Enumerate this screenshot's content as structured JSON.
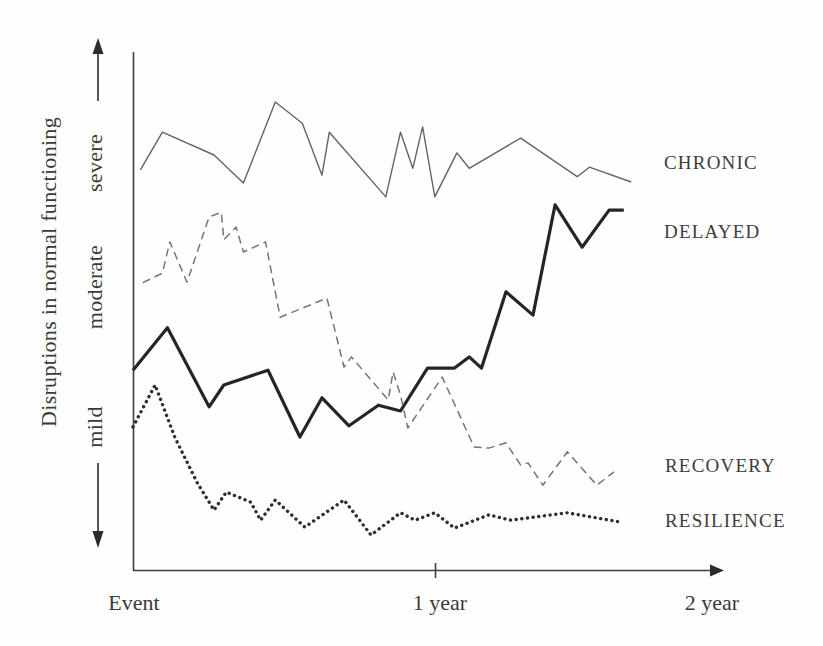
{
  "chart_data": {
    "type": "line",
    "title": "",
    "ylabel": "Disruptions in normal functioning",
    "xlabel": "",
    "x_axis": {
      "tick_labels": [
        "Event",
        "1 year",
        "2 year"
      ],
      "tick_months": [
        0,
        12,
        24
      ],
      "range_months": [
        0,
        24
      ]
    },
    "y_axis": {
      "tick_labels": [
        "severe",
        "moderate",
        "mild"
      ],
      "tick_positions": [
        77,
        53,
        27
      ],
      "range": [
        0,
        100
      ],
      "arrows": "double-ended"
    },
    "grid": false,
    "legend_position": "right of line endpoints",
    "axis_color": "#3f3f3f",
    "series": [
      {
        "name": "CHRONIC",
        "style": "thin-solid",
        "color": "#646464",
        "points": [
          [
            0.3,
            75.5
          ],
          [
            1.2,
            82.6
          ],
          [
            3.3,
            78.3
          ],
          [
            4.5,
            73.0
          ],
          [
            5.8,
            88.3
          ],
          [
            6.9,
            84.3
          ],
          [
            7.7,
            74.5
          ],
          [
            8.0,
            82.6
          ],
          [
            10.3,
            70.4
          ],
          [
            10.9,
            82.6
          ],
          [
            11.4,
            75.8
          ],
          [
            11.8,
            83.6
          ],
          [
            12.3,
            70.4
          ],
          [
            13.2,
            78.7
          ],
          [
            13.7,
            75.8
          ],
          [
            15.8,
            81.5
          ],
          [
            18.1,
            74.2
          ],
          [
            18.6,
            76.0
          ],
          [
            20.3,
            73.2
          ]
        ]
      },
      {
        "name": "DELAYED",
        "style": "thick-solid",
        "color": "#252525",
        "points": [
          [
            0.0,
            37.7
          ],
          [
            1.4,
            45.7
          ],
          [
            3.1,
            30.8
          ],
          [
            3.7,
            34.9
          ],
          [
            5.5,
            37.7
          ],
          [
            6.8,
            25.1
          ],
          [
            7.7,
            32.5
          ],
          [
            8.8,
            27.2
          ],
          [
            10.0,
            31.1
          ],
          [
            10.9,
            30.0
          ],
          [
            12.0,
            38.1
          ],
          [
            13.1,
            38.1
          ],
          [
            13.7,
            40.2
          ],
          [
            14.2,
            38.1
          ],
          [
            15.2,
            52.5
          ],
          [
            16.3,
            48.1
          ],
          [
            17.2,
            68.9
          ],
          [
            18.3,
            60.9
          ],
          [
            19.4,
            67.9
          ],
          [
            20.0,
            67.9
          ]
        ]
      },
      {
        "name": "RECOVERY",
        "style": "dashed",
        "color": "#757575",
        "points": [
          [
            0.4,
            54.2
          ],
          [
            1.2,
            56.0
          ],
          [
            1.5,
            61.9
          ],
          [
            2.2,
            54.3
          ],
          [
            3.1,
            66.6
          ],
          [
            3.6,
            67.5
          ],
          [
            3.7,
            62.3
          ],
          [
            4.2,
            64.7
          ],
          [
            4.5,
            60.0
          ],
          [
            5.4,
            61.9
          ],
          [
            6.0,
            47.7
          ],
          [
            7.9,
            51.3
          ],
          [
            8.6,
            38.3
          ],
          [
            8.9,
            40.2
          ],
          [
            10.4,
            32.1
          ],
          [
            10.6,
            37.4
          ],
          [
            10.9,
            33.0
          ],
          [
            11.2,
            26.8
          ],
          [
            12.6,
            36.4
          ],
          [
            13.9,
            23.2
          ],
          [
            14.5,
            23.0
          ],
          [
            15.2,
            24.0
          ],
          [
            15.8,
            19.8
          ],
          [
            16.1,
            20.2
          ],
          [
            16.7,
            16.0
          ],
          [
            17.7,
            22.3
          ],
          [
            18.9,
            16.0
          ],
          [
            19.6,
            18.5
          ]
        ]
      },
      {
        "name": "RESILIENCE",
        "style": "dotted",
        "color": "#303030",
        "points": [
          [
            0.0,
            27.0
          ],
          [
            0.9,
            34.9
          ],
          [
            1.7,
            25.1
          ],
          [
            2.6,
            16.6
          ],
          [
            3.3,
            11.3
          ],
          [
            3.8,
            14.7
          ],
          [
            4.8,
            12.8
          ],
          [
            5.2,
            9.4
          ],
          [
            5.8,
            13.2
          ],
          [
            7.0,
            8.1
          ],
          [
            8.6,
            13.2
          ],
          [
            9.7,
            6.6
          ],
          [
            10.9,
            10.8
          ],
          [
            11.5,
            9.4
          ],
          [
            12.3,
            10.8
          ],
          [
            13.1,
            7.9
          ],
          [
            14.5,
            10.4
          ],
          [
            15.4,
            9.4
          ],
          [
            17.7,
            10.8
          ],
          [
            19.8,
            9.1
          ]
        ]
      }
    ]
  }
}
